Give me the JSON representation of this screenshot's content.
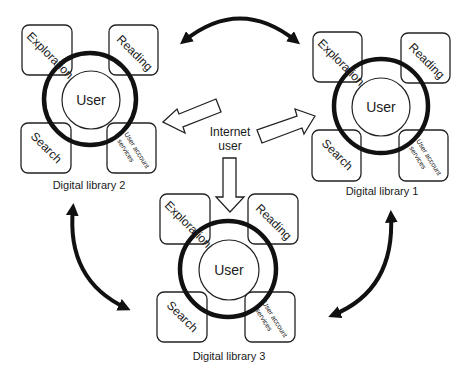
{
  "center": {
    "label_line1": "Internet",
    "label_line2": "user"
  },
  "libraries": [
    {
      "id": "dl2",
      "title": "Digital library 2",
      "core": "User",
      "modules": {
        "top_left": "Exploration",
        "top_right": "Reading",
        "bottom_left": "Search",
        "bottom_right_line1": "User account",
        "bottom_right_line2": "services"
      }
    },
    {
      "id": "dl1",
      "title": "Digital library 1",
      "core": "User",
      "modules": {
        "top_left": "Exploration",
        "top_right": "Reading",
        "bottom_left": "Search",
        "bottom_right_line1": "User account",
        "bottom_right_line2": "services"
      }
    },
    {
      "id": "dl3",
      "title": "Digital library 3",
      "core": "User",
      "modules": {
        "top_left": "Exploration",
        "top_right": "Reading",
        "bottom_left": "Search",
        "bottom_right_line1": "User account",
        "bottom_right_line2": "services"
      }
    }
  ],
  "connections": [
    {
      "from": "Internet user",
      "to": "Digital library 2",
      "type": "hollow-arrow"
    },
    {
      "from": "Internet user",
      "to": "Digital library 1",
      "type": "hollow-arrow"
    },
    {
      "from": "Internet user",
      "to": "Digital library 3",
      "type": "hollow-arrow"
    },
    {
      "between": [
        "Digital library 2",
        "Digital library 1"
      ],
      "type": "curved-double-arrow"
    },
    {
      "between": [
        "Digital library 2",
        "Digital library 3"
      ],
      "type": "curved-double-arrow"
    },
    {
      "between": [
        "Digital library 1",
        "Digital library 3"
      ],
      "type": "curved-double-arrow"
    }
  ],
  "colors": {
    "background": "#ffffff",
    "stroke": "#1a1a1a"
  }
}
